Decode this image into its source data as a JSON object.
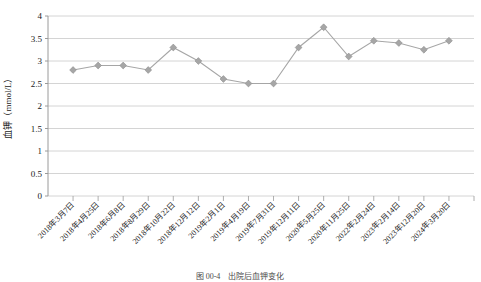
{
  "chart_data": {
    "type": "line",
    "title": "",
    "xlabel": "",
    "ylabel": "血钾（mmol/L）",
    "ylim": [
      0,
      4
    ],
    "ytick_labels": [
      "0",
      "0.5",
      "1",
      "1.5",
      "2",
      "2.5",
      "3",
      "3.5",
      "4"
    ],
    "ytick_values": [
      0,
      0.5,
      1,
      1.5,
      2,
      2.5,
      3,
      3.5,
      4
    ],
    "grid": true,
    "legend": false,
    "legend_position": "none",
    "marker": "diamond",
    "series_color": "#a6a6a6",
    "categories": [
      "2018年3月7日",
      "2018年4月25日",
      "2018年6月8日",
      "2018年8月29日",
      "2018年10月22日",
      "2018年12月12日",
      "2019年2月1日",
      "2019年4月19日",
      "2019年7月31日",
      "2019年12月11日",
      "2020年5月25日",
      "2020年11月25日",
      "2022年2月24日",
      "2023年2月14日",
      "2023年12月20日",
      "2024年3月20日"
    ],
    "values": [
      2.8,
      2.9,
      2.9,
      2.8,
      3.3,
      3.0,
      2.6,
      2.5,
      2.5,
      3.3,
      3.75,
      3.1,
      3.45,
      3.4,
      3.25,
      3.45
    ]
  },
  "caption": {
    "text": "图 00-4　出院后血钾变化"
  }
}
